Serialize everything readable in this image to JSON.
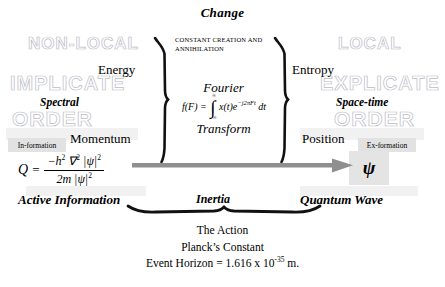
{
  "title": "Change",
  "center": {
    "constant_creation": "CONSTANT CREATION AND ANNIHILATION",
    "fourier_top": "Fourier",
    "fourier_bottom": "Transform",
    "equation": {
      "lhs": "f(F)",
      "equals": "=",
      "integral_symbol": "∫",
      "limit_upper": "∞",
      "limit_lower": "−∞",
      "integrand": "x(t)e",
      "exponent": "−j2πFt",
      "differential": "dt"
    }
  },
  "left": {
    "watermarks": [
      "NON-LOCAL",
      "IMPLICATE",
      "ORDER"
    ],
    "energy": "Energy",
    "spectral": "Spectral",
    "momentum": "Momentum",
    "information_box": "In-formation",
    "active_information": "Active Information",
    "quantum_potential": {
      "symbol": "Q",
      "equals": "=",
      "numerator_prefix": "−h",
      "numerator_exp": "2",
      "nabla": "∇",
      "nabla_exp": "2",
      "numerator_psi": "|ψ|",
      "numerator_psi_exp": "2",
      "denominator_mass": "2m",
      "denominator_psi": "|ψ|",
      "denominator_psi_exp": "2"
    }
  },
  "right": {
    "watermarks": [
      "LOCAL",
      "EXPLICATE",
      "ORDER"
    ],
    "entropy": "Entropy",
    "space_time": "Space-time",
    "position": "Position",
    "exformation_box": "Ex-formation",
    "psi_symbol": "ψ",
    "quantum_wave": "Quantum Wave"
  },
  "middle_label": "Inertia",
  "caption": {
    "line1": "The Action",
    "line2": "Planck’s Constant",
    "line3_prefix": "Event Horizon = 1.616 x 10",
    "line3_exp": "-35",
    "line3_suffix": " m."
  },
  "colors": {
    "ink": "#000000",
    "watermark_stroke": "#b9b9c4",
    "gray_box": "#e2e2e2",
    "arrow_gray": "#8f8f8f",
    "background": "#ffffff"
  }
}
